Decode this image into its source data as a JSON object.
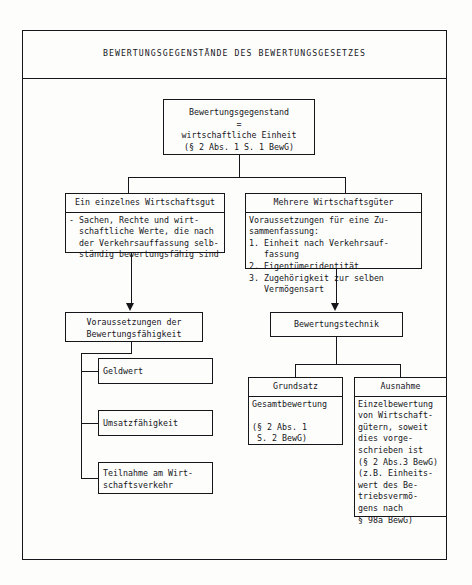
{
  "document": {
    "title": "BEWERTUNGSGEGENSTÄNDE DES BEWERTUNGSGESETZES"
  },
  "boxes": {
    "top": {
      "name": "bewertungsgegenstand",
      "line1": "Bewertungsgegenstand",
      "line2": "=",
      "line3": "wirtschaftliche Einheit",
      "line4": "(§ 2 Abs. 1 S. 1 BewG)"
    },
    "single_asset": {
      "header": "Ein einzelnes Wirtschaftsgut",
      "body": "- Sachen, Rechte und wirt-\n  schaftliche Werte, die nach\n  der Verkehrsauffassung selb-\n  ständig bewertungsfähig sind"
    },
    "multiple_assets": {
      "header": "Mehrere Wirtschaftsgüter",
      "body": "Voraussetzungen für eine Zu-\nsammenfassung:\n1. Einheit nach Verkehrsauf-\n   fassung\n2. Eigentümeridentität\n3. Zugehörigkeit zur selben\n   Vermögensart"
    },
    "prerequisites": {
      "line1": "Voraussetzungen der",
      "line2": "Bewertungsfähigkeit"
    },
    "technique": {
      "label": "Bewertungstechnik"
    },
    "monetary_value": {
      "label": "Geldwert"
    },
    "marketability": {
      "label": "Umsatzfähigkeit"
    },
    "participation": {
      "label": "Teilnahme am Wirt-\nschaftsverkehr"
    },
    "principle": {
      "header": "Grundsatz",
      "body": "Gesamtbewertung\n\n(§ 2 Abs. 1\n S. 2 BewG)"
    },
    "exception": {
      "header": "Ausnahme",
      "body": "Einzelbewertung\nvon Wirtschaft-\ngütern, soweit\ndies vorge-\nschrieben ist\n(§ 2 Abs.3 BewG)\n(z.B. Einheits-\nwert des Be-\ntriebsvermö-\ngens nach\n§ 98a BewG)"
    }
  },
  "style": {
    "ink": "#15151a",
    "paper": "#fdfdfc"
  }
}
